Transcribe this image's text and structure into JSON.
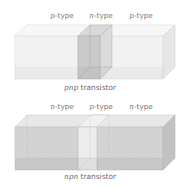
{
  "figures": [
    {
      "id": "pnp",
      "caption_prefix": "pnp",
      "caption_suffix": " transistor",
      "regions": [
        {
          "type_prefix": "p",
          "type_suffix": "-type"
        },
        {
          "type_prefix": "n",
          "type_suffix": "-type"
        },
        {
          "type_prefix": "p",
          "type_suffix": "-type"
        }
      ],
      "colors": {
        "outer": "#f0f0f0",
        "middle": "#c8c8c8"
      }
    },
    {
      "id": "npn",
      "caption_prefix": "npn",
      "caption_suffix": " transistor",
      "regions": [
        {
          "type_prefix": "n",
          "type_suffix": "-type"
        },
        {
          "type_prefix": "p",
          "type_suffix": "-type"
        },
        {
          "type_prefix": "n",
          "type_suffix": "-type"
        }
      ],
      "colors": {
        "outer": "#cfcfcf",
        "middle": "#e6e6e6"
      }
    }
  ]
}
